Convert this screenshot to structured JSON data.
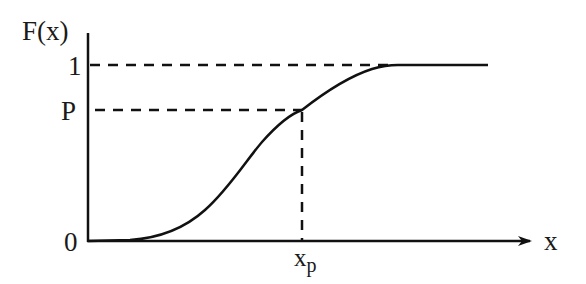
{
  "diagram": {
    "y_axis_label": "F(x)",
    "x_axis_label": "x",
    "y_ticks": [
      {
        "label": "1",
        "value": 1
      },
      {
        "label": "P",
        "value": "P"
      },
      {
        "label": "0",
        "value": 0
      }
    ],
    "x_marker": {
      "base": "x",
      "subscript": "p"
    },
    "colors": {
      "line": "#111111",
      "background": "#ffffff"
    }
  }
}
